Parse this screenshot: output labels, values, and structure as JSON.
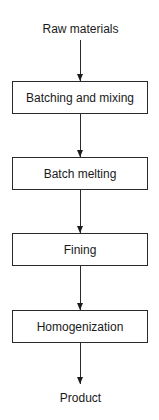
{
  "diagram": {
    "type": "flowchart",
    "direction": "top-to-bottom",
    "input": "Raw materials",
    "steps": [
      {
        "label": "Batching and mixing"
      },
      {
        "label": "Batch melting"
      },
      {
        "label": "Fining"
      },
      {
        "label": "Homogenization"
      }
    ],
    "output": "Product",
    "colors": {
      "line": "#2a2a2a",
      "text": "#1a1a1a",
      "background": "#ffffff"
    }
  }
}
